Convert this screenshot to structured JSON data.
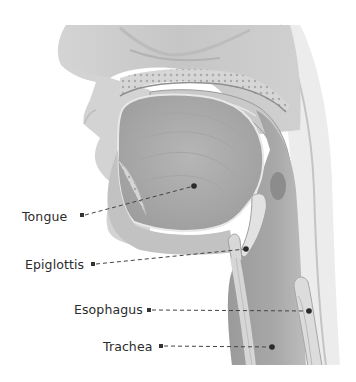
{
  "diagram": {
    "labels": [
      {
        "id": "tongue",
        "text": "Tongue",
        "marker": [
          82,
          215
        ],
        "target": [
          194,
          186
        ]
      },
      {
        "id": "epiglottis",
        "text": "Epiglottis",
        "marker": [
          93,
          264
        ],
        "target": [
          246,
          249
        ]
      },
      {
        "id": "esophagus",
        "text": "Esophagus",
        "marker": [
          149,
          310
        ],
        "target": [
          309,
          311
        ]
      },
      {
        "id": "trachea",
        "text": "Trachea",
        "marker": [
          161,
          346
        ],
        "target": [
          272,
          347
        ]
      }
    ],
    "colors": {
      "background": "#ffffff",
      "label_text": "#2b2b2b",
      "leader_line": "#444444",
      "tissue_light": "#d9d9d9",
      "tissue_mid": "#b8b8b8",
      "tissue_dark": "#8c8c8c"
    }
  }
}
